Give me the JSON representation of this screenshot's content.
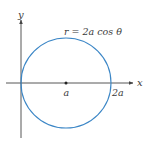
{
  "diagram": {
    "type": "polar-curve-plot",
    "equation_label": "r = 2a cos θ",
    "axes": {
      "x_label": "x",
      "y_label": "y"
    },
    "points": [
      {
        "label": "a",
        "description": "center of circle, marked with dot"
      },
      {
        "label": "2a",
        "description": "rightmost intersection with x-axis"
      }
    ],
    "colors": {
      "curve": "#3b86c6",
      "axes": "#444444",
      "text": "#3a3a3a"
    }
  }
}
